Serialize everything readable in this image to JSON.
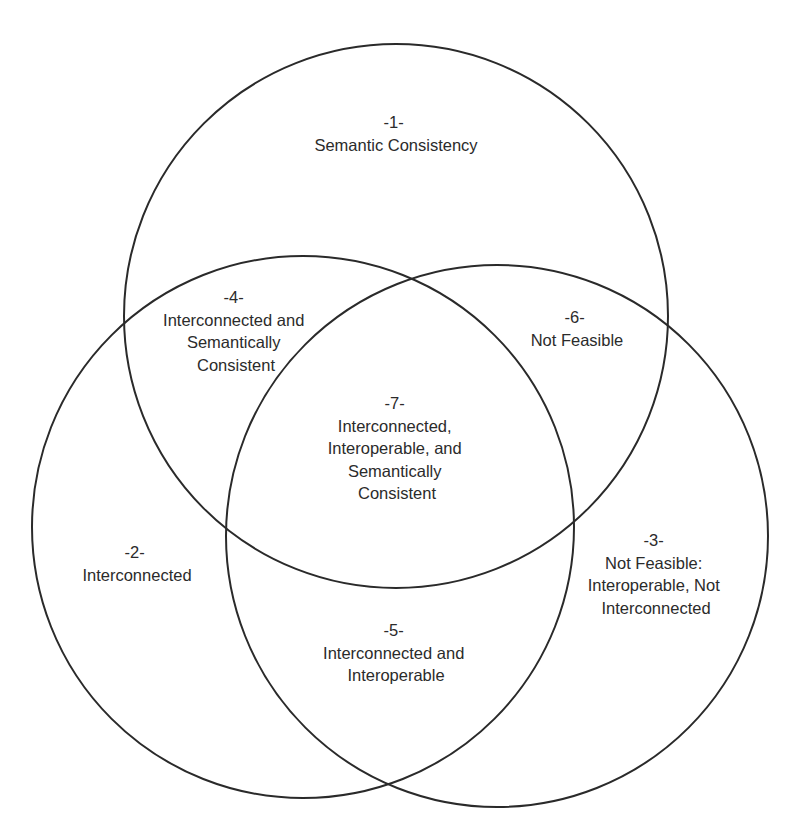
{
  "diagram": {
    "type": "venn",
    "canvas": {
      "width": 795,
      "height": 840
    },
    "stroke_color": "#2a2a2a",
    "text_color": "#2b2b2b",
    "circles": [
      {
        "id": "semantic-consistency",
        "cx": 396,
        "cy": 316,
        "r": 272
      },
      {
        "id": "interconnected",
        "cx": 303,
        "cy": 527,
        "r": 271
      },
      {
        "id": "interoperable",
        "cx": 497,
        "cy": 536,
        "r": 271
      }
    ],
    "regions": [
      {
        "number": "-1-",
        "lines": [
          "Semantic Consistency"
        ],
        "x": 396,
        "y": 128
      },
      {
        "number": "-2-",
        "lines": [
          "Interconnected"
        ],
        "x": 137,
        "y": 558
      },
      {
        "number": "-3-",
        "lines": [
          "Not Feasible:",
          "Interoperable, Not",
          "Interconnected"
        ],
        "x": 656,
        "y": 546
      },
      {
        "number": "-4-",
        "lines": [
          "Interconnected and",
          "Semantically",
          "Consistent"
        ],
        "x": 236,
        "y": 303
      },
      {
        "number": "-5-",
        "lines": [
          "Interconnected and",
          "Interoperable"
        ],
        "x": 396,
        "y": 636
      },
      {
        "number": "-6-",
        "lines": [
          "Not Feasible"
        ],
        "x": 577,
        "y": 323
      },
      {
        "number": "-7-",
        "lines": [
          "Interconnected,",
          "Interoperable, and",
          "Semantically",
          "Consistent"
        ],
        "x": 397,
        "y": 409
      }
    ],
    "line_height": 22.5
  }
}
